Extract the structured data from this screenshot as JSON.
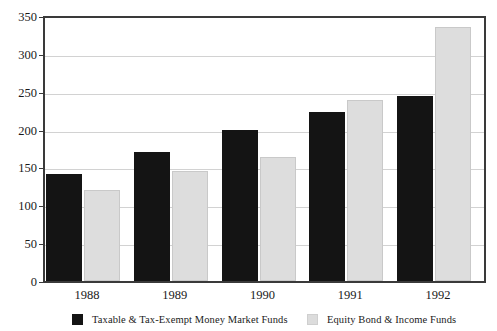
{
  "chart_data": {
    "type": "bar",
    "title": "",
    "xlabel": "",
    "ylabel": "",
    "categories": [
      "1988",
      "1989",
      "1990",
      "1991",
      "1992"
    ],
    "series": [
      {
        "name": "Taxable & Tax-Exempt Money Market Funds",
        "color": "#141414",
        "values": [
          141,
          171,
          200,
          223,
          245
        ]
      },
      {
        "name": "Equity Bond & Income Funds",
        "color": "#dddddd",
        "values": [
          120,
          145,
          164,
          239,
          336
        ]
      }
    ],
    "ylim": [
      0,
      350
    ],
    "yticks": [
      0,
      50,
      100,
      150,
      200,
      250,
      300,
      350
    ],
    "ytick_labels": [
      "0",
      "50",
      "100",
      "150",
      "200",
      "250",
      "300",
      "350"
    ],
    "grid": true,
    "legend_position": "bottom"
  },
  "legend": {
    "items": [
      {
        "label": "Taxable & Tax-Exempt Money Market Funds",
        "swatch": "dark-swatch"
      },
      {
        "label": "Equity Bond & Income Funds",
        "swatch": "light-swatch"
      }
    ]
  }
}
